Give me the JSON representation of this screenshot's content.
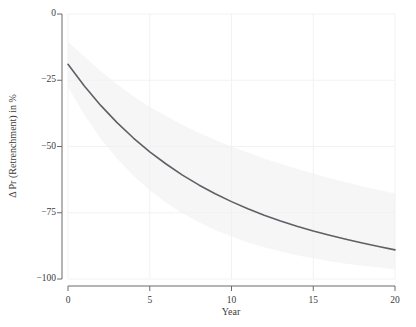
{
  "chart_data": {
    "type": "line",
    "title": "",
    "xlabel": "Year",
    "ylabel": "Δ Pr (Retrenchment) in %",
    "xlim": [
      0,
      20
    ],
    "ylim": [
      -100,
      0
    ],
    "xticks": [
      0,
      5,
      10,
      15,
      20
    ],
    "xtick_labels": [
      "0",
      "5",
      "10",
      "15",
      "20"
    ],
    "yticks": [
      0,
      -25,
      -50,
      -75,
      -100
    ],
    "ytick_labels": [
      "0",
      "−25",
      "−50",
      "−75",
      "−100"
    ],
    "grid": true,
    "legend": "none",
    "line_color": "#5f5f66",
    "band_color": "#eeeeee",
    "grid_color": "#f2f2f4",
    "axis_color": "#6b6b6b",
    "background": "#ffffff",
    "series": [
      {
        "name": "Δ Pr (Retrenchment)",
        "x": [
          0,
          1,
          2,
          3,
          4,
          5,
          6,
          7,
          8,
          9,
          10,
          11,
          12,
          13,
          14,
          15,
          16,
          17,
          18,
          19,
          20
        ],
        "values": [
          -19.0,
          -27.2,
          -34.5,
          -41.0,
          -46.8,
          -52.0,
          -56.6,
          -60.8,
          -64.5,
          -67.8,
          -70.8,
          -73.5,
          -75.9,
          -78.1,
          -80.1,
          -81.9,
          -83.5,
          -85.0,
          -86.4,
          -87.7,
          -89.0
        ],
        "ci_upper": [
          -10.5,
          -16.0,
          -21.5,
          -26.5,
          -31.0,
          -35.0,
          -38.5,
          -41.8,
          -44.8,
          -47.5,
          -50.0,
          -52.3,
          -54.5,
          -56.5,
          -58.4,
          -60.2,
          -61.9,
          -63.5,
          -65.0,
          -66.4,
          -67.7
        ],
        "ci_lower": [
          -27.5,
          -38.0,
          -47.0,
          -54.5,
          -61.0,
          -66.5,
          -71.2,
          -75.2,
          -78.6,
          -81.5,
          -84.0,
          -86.2,
          -88.0,
          -89.6,
          -91.0,
          -92.2,
          -93.3,
          -94.2,
          -95.0,
          -95.7,
          -96.3
        ]
      }
    ]
  }
}
